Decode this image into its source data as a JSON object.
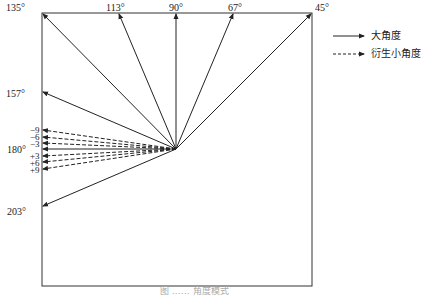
{
  "diagram": {
    "angle_labels_top": [
      "135°",
      "113°",
      "90°",
      "67°",
      "45°"
    ],
    "angle_labels_left": [
      "157°",
      "180°",
      "203°"
    ],
    "small_angle_labels": [
      "−9",
      "−6",
      "−3",
      "+3",
      "+6",
      "+9"
    ],
    "legend": {
      "solid_label": "大角度",
      "dashed_label": "衍生小角度"
    },
    "caption": "图 ……  角度模式"
  }
}
